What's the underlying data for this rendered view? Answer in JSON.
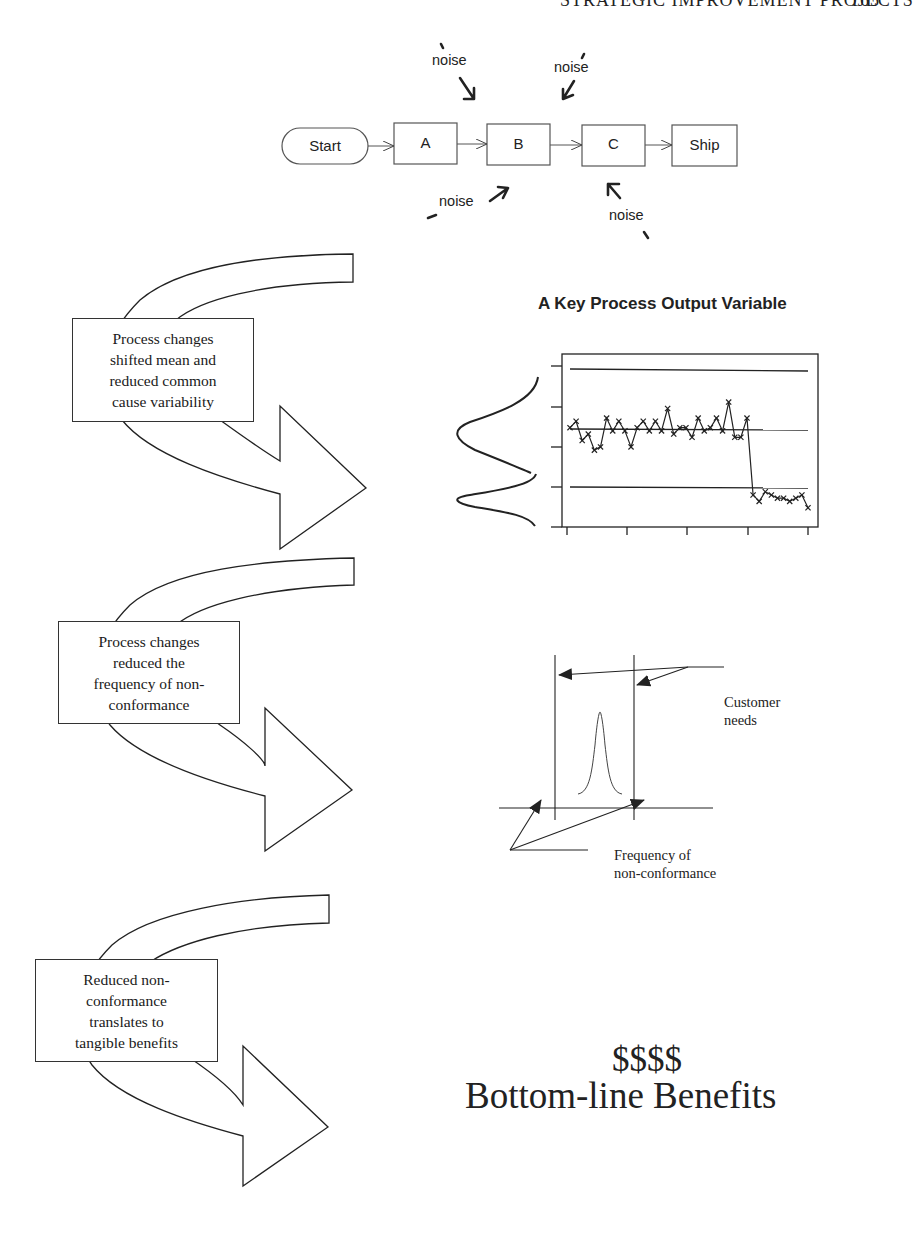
{
  "page": {
    "running_header": "STRATEGIC IMPROVEMENT PROJECTS",
    "page_number": "165"
  },
  "flowchart": {
    "nodes": [
      {
        "id": "start",
        "label": "Start",
        "shape": "pill"
      },
      {
        "id": "a",
        "label": "A",
        "shape": "box"
      },
      {
        "id": "b",
        "label": "B",
        "shape": "box"
      },
      {
        "id": "c",
        "label": "C",
        "shape": "box"
      },
      {
        "id": "ship",
        "label": "Ship",
        "shape": "box"
      }
    ],
    "noise_labels": [
      {
        "label": "noise",
        "target": "between A and B (top)"
      },
      {
        "label": "noise",
        "target": "between B and C (top)"
      },
      {
        "label": "noise",
        "target": "between A and B (bottom)"
      },
      {
        "label": "noise",
        "target": "C (bottom)"
      }
    ]
  },
  "stages": [
    {
      "callout": [
        "Process changes",
        "shifted mean and",
        "reduced common",
        "cause variability"
      ],
      "arrow_icon": "curved-arrow-icon"
    },
    {
      "callout": [
        "Process changes",
        "reduced the",
        "frequency of non-",
        "conformance"
      ],
      "arrow_icon": "curved-arrow-icon"
    },
    {
      "callout": [
        "Reduced non-",
        "conformance",
        "translates to",
        "tangible benefits"
      ],
      "arrow_icon": "curved-arrow-icon"
    }
  ],
  "control_chart": {
    "title": "A Key Process Output Variable"
  },
  "capability": {
    "customer_needs": [
      "Customer",
      "needs"
    ],
    "frequency": [
      "Frequency of",
      "non-conformance"
    ]
  },
  "benefits": {
    "symbols": "$$$$",
    "label": "Bottom-line Benefits"
  },
  "chart_data": {
    "type": "line",
    "title": "A Key Process Output Variable",
    "xlabel": "",
    "ylabel": "",
    "grid": false,
    "legend": "none",
    "x": [
      1,
      2,
      3,
      4,
      5,
      6,
      7,
      8,
      9,
      10,
      11,
      12,
      13,
      14,
      15,
      16,
      17,
      18,
      19,
      20,
      21,
      22,
      23,
      24,
      25,
      26,
      27,
      28,
      29,
      30,
      31,
      32,
      33,
      34,
      35,
      36,
      37,
      38,
      39,
      40
    ],
    "series": [
      {
        "name": "Process output",
        "marker": "x",
        "values": [
          5.0,
          5.4,
          4.2,
          4.6,
          3.6,
          3.8,
          5.6,
          4.8,
          5.4,
          4.8,
          3.8,
          5.0,
          5.4,
          4.8,
          5.4,
          4.8,
          6.2,
          4.6,
          5.0,
          5.0,
          4.4,
          5.6,
          4.8,
          5.0,
          5.6,
          4.8,
          6.6,
          4.4,
          4.4,
          5.6,
          0.8,
          0.4,
          1.0,
          0.8,
          0.6,
          0.6,
          0.4,
          0.6,
          0.8,
          0.0
        ]
      }
    ],
    "reference_lines": [
      {
        "name": "Upper control limit",
        "y": 8.6
      },
      {
        "name": "Center line",
        "y": 5.0
      },
      {
        "name": "Lower control limit",
        "y": 1.6
      }
    ],
    "ylim": [
      -1.2,
      9.6
    ],
    "y_ticks_count": 5,
    "x_ticks_count": 5,
    "side_distributions": [
      {
        "name": "before",
        "center": 5.0,
        "spread": "wide"
      },
      {
        "name": "after",
        "center": 1.0,
        "spread": "narrow"
      }
    ]
  }
}
